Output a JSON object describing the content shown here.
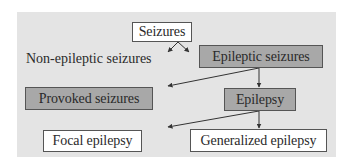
{
  "diagram": {
    "type": "flowchart",
    "colors": {
      "panel_background": "#e4e4e4",
      "dark_box": "#a8a8a8",
      "light_box": "#ffffff",
      "line": "#333333"
    },
    "nodes": {
      "seizures": "Seizures",
      "non_epileptic": "Non-epileptic seizures",
      "epileptic": "Epileptic seizures",
      "provoked": "Provoked seizures",
      "epilepsy": "Epilepsy",
      "focal": "Focal epilepsy",
      "generalized": "Generalized epilepsy"
    },
    "edges": [
      {
        "from": "Seizures",
        "to": "Non-epileptic seizures"
      },
      {
        "from": "Seizures",
        "to": "Epileptic seizures"
      },
      {
        "from": "Epileptic seizures",
        "to": "Provoked seizures"
      },
      {
        "from": "Epileptic seizures",
        "to": "Epilepsy"
      },
      {
        "from": "Epilepsy",
        "to": "Focal epilepsy"
      },
      {
        "from": "Epilepsy",
        "to": "Generalized epilepsy"
      }
    ]
  }
}
